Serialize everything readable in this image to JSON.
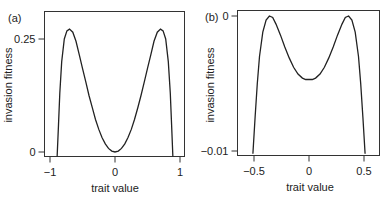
{
  "chart_data": [
    {
      "type": "line",
      "panel_label": "(a)",
      "title": "",
      "xlabel": "trait value",
      "ylabel": "invasion fitness",
      "xlim": [
        -1.06,
        1.06
      ],
      "ylim": [
        -0.012,
        0.31
      ],
      "xticks": [
        -1,
        0,
        1
      ],
      "xtick_labels": [
        "-1",
        "0",
        "1"
      ],
      "yticks": [
        0,
        0.25
      ],
      "ytick_labels": [
        "0",
        "0.25"
      ],
      "grid": false,
      "legend": null,
      "series": [
        {
          "name": "invasion fitness",
          "x": [
            -0.89,
            -0.87,
            -0.85,
            -0.82,
            -0.78,
            -0.74,
            -0.7,
            -0.65,
            -0.6,
            -0.55,
            -0.5,
            -0.45,
            -0.4,
            -0.35,
            -0.3,
            -0.25,
            -0.2,
            -0.15,
            -0.1,
            -0.05,
            0.0,
            0.05,
            0.1,
            0.15,
            0.2,
            0.25,
            0.3,
            0.35,
            0.4,
            0.45,
            0.5,
            0.55,
            0.6,
            0.65,
            0.7,
            0.74,
            0.78,
            0.82,
            0.85,
            0.87,
            0.89
          ],
          "y": [
            -0.012,
            0.06,
            0.13,
            0.2,
            0.25,
            0.268,
            0.272,
            0.265,
            0.245,
            0.215,
            0.185,
            0.155,
            0.125,
            0.098,
            0.072,
            0.05,
            0.032,
            0.018,
            0.008,
            0.002,
            0.0,
            0.002,
            0.008,
            0.018,
            0.032,
            0.05,
            0.072,
            0.098,
            0.125,
            0.155,
            0.185,
            0.215,
            0.245,
            0.265,
            0.272,
            0.268,
            0.25,
            0.2,
            0.13,
            0.06,
            -0.012
          ]
        }
      ]
    },
    {
      "type": "line",
      "panel_label": "(b)",
      "title": "",
      "xlabel": "trait value",
      "ylabel": "invasion fitness",
      "xlim": [
        -0.6,
        0.62
      ],
      "ylim": [
        -0.0102,
        0.0004
      ],
      "xticks": [
        -0.5,
        0,
        0.5
      ],
      "xtick_labels": [
        "-0.5",
        "0",
        "0.5"
      ],
      "yticks": [
        -0.01,
        0
      ],
      "ytick_labels": [
        "-0.01",
        "0"
      ],
      "grid": false,
      "legend": null,
      "series": [
        {
          "name": "invasion fitness",
          "x": [
            -0.51,
            -0.49,
            -0.47,
            -0.45,
            -0.42,
            -0.39,
            -0.36,
            -0.33,
            -0.3,
            -0.26,
            -0.22,
            -0.18,
            -0.14,
            -0.1,
            -0.06,
            -0.03,
            0.0,
            0.03,
            0.06,
            0.1,
            0.14,
            0.18,
            0.22,
            0.26,
            0.3,
            0.33,
            0.36,
            0.39,
            0.42,
            0.45,
            0.47,
            0.49,
            0.51
          ],
          "y": [
            -0.0102,
            -0.0075,
            -0.005,
            -0.003,
            -0.0012,
            -0.0003,
            0.0,
            -0.0001,
            -0.0006,
            -0.0014,
            -0.0023,
            -0.0031,
            -0.0038,
            -0.0043,
            -0.0046,
            -0.0047,
            -0.0047,
            -0.0047,
            -0.0046,
            -0.0043,
            -0.0038,
            -0.0031,
            -0.0023,
            -0.0014,
            -0.0006,
            -0.0001,
            0.0,
            -0.0003,
            -0.0012,
            -0.003,
            -0.005,
            -0.0075,
            -0.0102
          ]
        }
      ]
    }
  ],
  "panels": [
    {
      "label": "(a)",
      "xlabel": "trait value",
      "ylabel": "invasion fitness"
    },
    {
      "label": "(b)",
      "xlabel": "trait value",
      "ylabel": "invasion fitness"
    }
  ]
}
